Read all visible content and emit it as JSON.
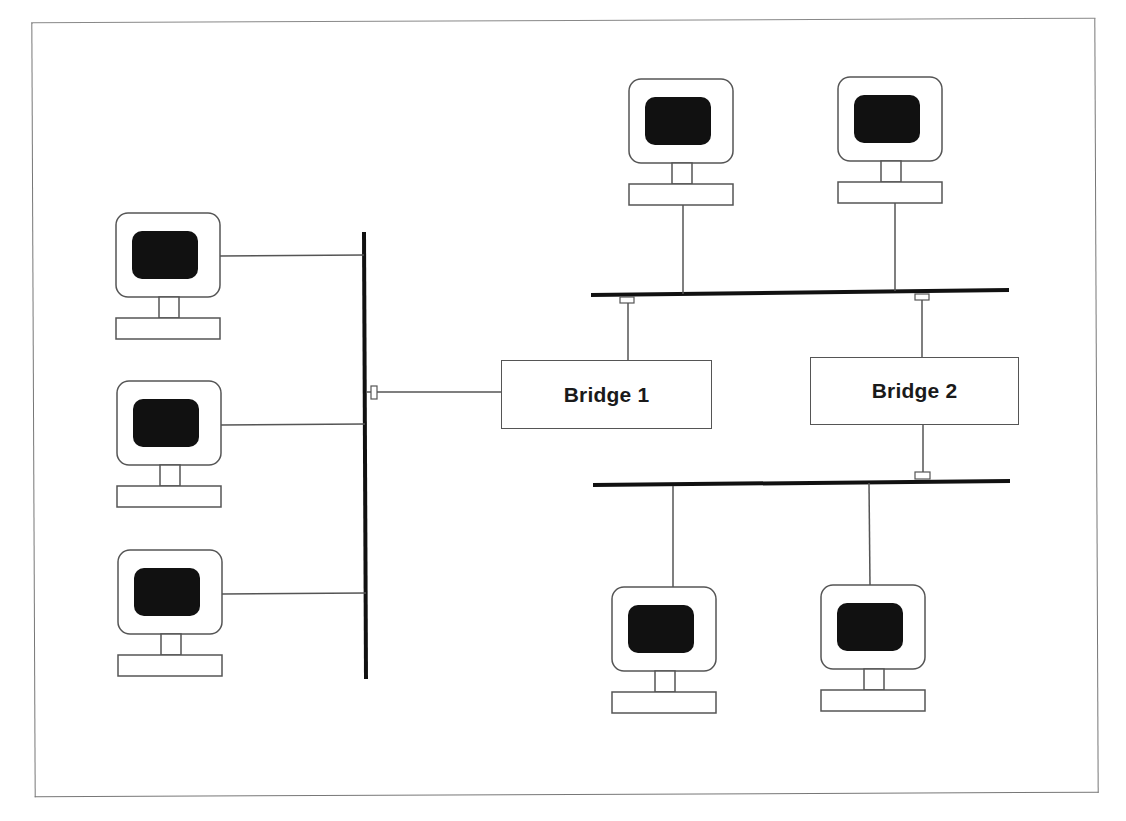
{
  "diagram": {
    "type": "network-topology",
    "colors": {
      "line": "#555555",
      "bus": "#111111",
      "screen": "#111111",
      "frame": "#777777",
      "background": "#ffffff"
    },
    "bridges": [
      {
        "id": "bridge1",
        "label": "Bridge 1"
      },
      {
        "id": "bridge2",
        "label": "Bridge 2"
      }
    ],
    "segments": [
      {
        "id": "segment-left",
        "orientation": "vertical",
        "computers": 3,
        "connects_to": [
          "bridge1"
        ]
      },
      {
        "id": "segment-top",
        "orientation": "horizontal",
        "computers": 2,
        "connects_to": [
          "bridge1",
          "bridge2"
        ]
      },
      {
        "id": "segment-bottom",
        "orientation": "horizontal",
        "computers": 2,
        "connects_to": [
          "bridge2"
        ]
      }
    ],
    "computer_icon": "monitor-icon",
    "port_icon": "port-connector-icon"
  }
}
